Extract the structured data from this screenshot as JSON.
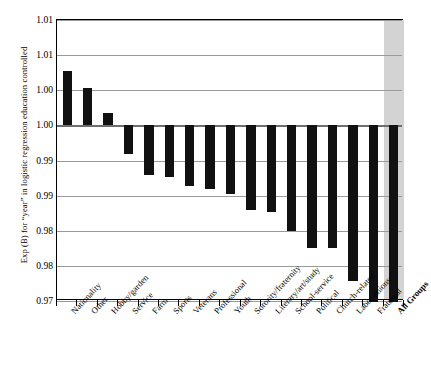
{
  "chart_data": {
    "type": "bar",
    "title": "",
    "xlabel": "",
    "ylabel": "Exp (B) for “year” in logistic regression education controlled",
    "ylim": [
      0.975,
      1.015
    ],
    "baseline": 1.0,
    "grid": true,
    "legend": null,
    "ytick_values": [
      1.015,
      1.01,
      1.005,
      1.0,
      0.995,
      0.99,
      0.985,
      0.98,
      0.975
    ],
    "ytick_labels": [
      "1.01",
      "1.01",
      "1.00",
      "1.00",
      "0.99",
      "0.99",
      "0.98",
      "0.98",
      "0.97"
    ],
    "categories": [
      "Nationality",
      "Other",
      "Hobby/garden",
      "Service",
      "Farm",
      "Sports",
      "Veterans",
      "Professional",
      "Youth",
      "Sorority/fraternity",
      "Literary/art/study",
      "School-service",
      "Political",
      "Church-related",
      "Labor unions",
      "Fraternal",
      "All Groups"
    ],
    "values": [
      1.0078,
      1.0053,
      1.0017,
      0.9959,
      0.993,
      0.9927,
      0.9913,
      0.991,
      0.9902,
      0.9879,
      0.9876,
      0.985,
      0.9826,
      0.9825,
      0.9778,
      0.9749,
      0.9749
    ],
    "highlight_category": "All Groups",
    "colors": {
      "bar": "#111111",
      "highlight_band": "#d3d3d3",
      "grid": "#9a9a9a",
      "axis": "#000000",
      "background": "#ffffff"
    }
  }
}
